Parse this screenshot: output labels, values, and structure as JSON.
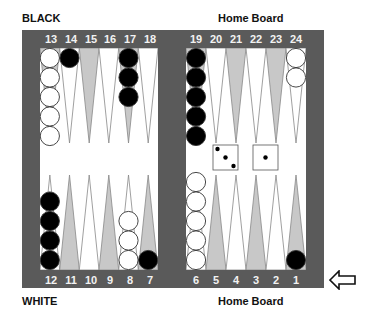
{
  "labels": {
    "top_left": "BLACK",
    "bottom_left": "WHITE",
    "top_right": "Home Board",
    "bottom_right": "Home Board"
  },
  "colors": {
    "frame": "#5a5a5a",
    "field": "#ffffff",
    "point_light": "#ffffff",
    "point_dark": "#c8c8c8",
    "checker_black": "#000000",
    "checker_white": "#ffffff"
  },
  "points": {
    "top_left": [
      "13",
      "14",
      "15",
      "16",
      "17",
      "18"
    ],
    "top_right": [
      "19",
      "20",
      "21",
      "22",
      "23",
      "24"
    ],
    "bottom_left": [
      "12",
      "11",
      "10",
      "9",
      "8",
      "7"
    ],
    "bottom_right": [
      "6",
      "5",
      "4",
      "3",
      "2",
      "1"
    ]
  },
  "checkers": [
    {
      "point": 13,
      "color": "white",
      "count": 5
    },
    {
      "point": 14,
      "color": "black",
      "count": 1
    },
    {
      "point": 17,
      "color": "black",
      "count": 3
    },
    {
      "point": 19,
      "color": "black",
      "count": 5
    },
    {
      "point": 24,
      "color": "white",
      "count": 2
    },
    {
      "point": 12,
      "color": "black",
      "count": 4
    },
    {
      "point": 8,
      "color": "white",
      "count": 3
    },
    {
      "point": 7,
      "color": "black",
      "count": 1
    },
    {
      "point": 6,
      "color": "white",
      "count": 5
    },
    {
      "point": 1,
      "color": "black",
      "count": 1
    }
  ],
  "dice": [
    3,
    1
  ],
  "turn_indicator": "arrow-left-icon"
}
